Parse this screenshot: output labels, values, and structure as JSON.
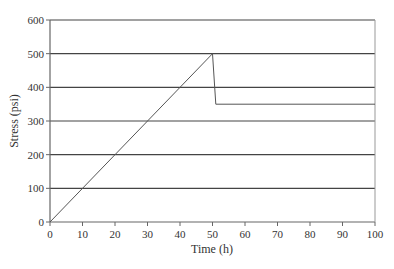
{
  "chart_data": {
    "type": "line",
    "title": "",
    "xlabel": "Time (h)",
    "ylabel": "Stress (psi)",
    "xlim": [
      0,
      100
    ],
    "ylim": [
      0,
      600
    ],
    "x_ticks": [
      0,
      10,
      20,
      30,
      40,
      50,
      60,
      70,
      80,
      90,
      100
    ],
    "y_ticks": [
      0,
      100,
      200,
      300,
      400,
      500,
      600
    ],
    "grid": {
      "horizontal": true,
      "vertical": false
    },
    "legend": null,
    "series": [
      {
        "name": "Stress",
        "points": [
          {
            "x": 0,
            "y": 0
          },
          {
            "x": 50,
            "y": 500
          },
          {
            "x": 51,
            "y": 350
          },
          {
            "x": 100,
            "y": 350
          }
        ]
      }
    ]
  },
  "colors": {
    "line": "#555555",
    "grid": "#444444",
    "axis": "#666666",
    "text": "#333333"
  }
}
